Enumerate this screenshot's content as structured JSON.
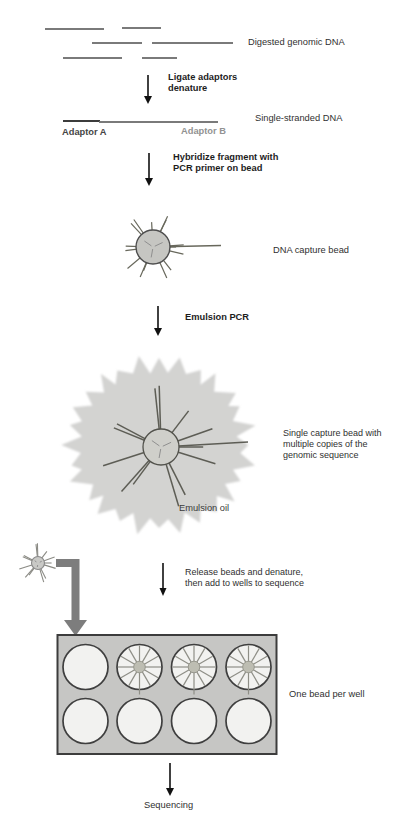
{
  "diagram": {
    "title_context": "Emulsion PCR bead sequencing workflow",
    "labels": {
      "digested": "Digested genomic DNA",
      "ligate": "Ligate adaptors\ndenature",
      "ssdna": "Single-stranded DNA",
      "adaptorA": "Adaptor A",
      "adaptorB": "Adaptor B",
      "hybridize": "Hybridize fragment with\nPCR primer on bead",
      "capture_bead": "DNA capture bead",
      "emulsion_pcr": "Emulsion PCR",
      "single_capture": "Single capture bead with\nmultiple copies of the\ngenomic sequence",
      "emulsion_oil": "Emulsion oil",
      "release": "Release beads and denature,\nthen add to wells to sequence",
      "one_bead": "One bead per well",
      "sequencing": "Sequencing"
    },
    "plate": {
      "wells_total": 8,
      "wells_with_beads": 3,
      "rows": 2,
      "columns": 4
    },
    "icons": {
      "down-arrow-icon": "↓ thin black arrow",
      "elbow-arrow-icon": "thick gray right-angle arrow",
      "bead-icon": "circle with radiating DNA strands",
      "emulsion-droplet-icon": "gray starburst oil droplet"
    },
    "colors": {
      "text": "#303030",
      "bold_text": "#1d1d1d",
      "adaptor_b_gray": "#929292",
      "dna_line_gray": "#7a7a7a",
      "dna_line_dark": "#3c3c3c",
      "arrow_black": "#111111",
      "elbow_arrow_gray": "#7d7d7d",
      "bead_fill": "#c6c6c2",
      "bead_spike": "#68685c",
      "emulsion_oil_fill": "#d3d3d1",
      "plate_fill": "#c6c6c4",
      "well_fill": "#f2f2f0",
      "well_outline": "#3f3f3f"
    }
  }
}
